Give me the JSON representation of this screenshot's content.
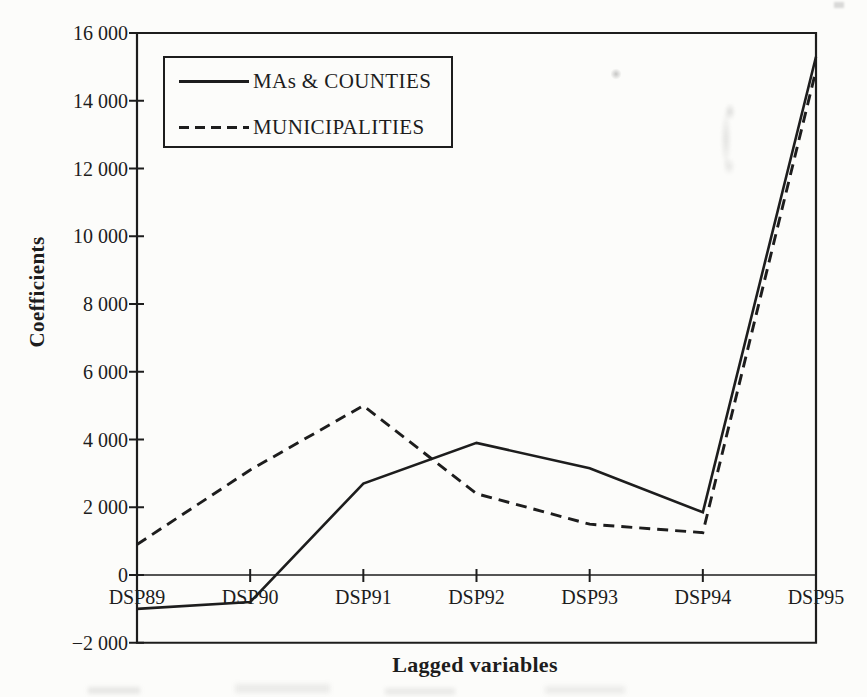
{
  "figure": {
    "background_color": "#fcfcfa",
    "ink_color": "#1d1d1d"
  },
  "chart_data": {
    "type": "line",
    "title": "",
    "xlabel": "Lagged variables",
    "ylabel": "Coefficients",
    "categories": [
      "DSP89",
      "DSP90",
      "DSP91",
      "DSP92",
      "DSP93",
      "DSP94",
      "DSP95"
    ],
    "series": [
      {
        "name": "MAs & COUNTIES",
        "style": "solid",
        "values": [
          -1000,
          -800,
          2700,
          3900,
          3150,
          1850,
          15300
        ]
      },
      {
        "name": "MUNICIPALITIES",
        "style": "dashed",
        "values": [
          900,
          3100,
          5000,
          2400,
          1500,
          1250,
          14900
        ]
      }
    ],
    "ylim": [
      -2000,
      16000
    ],
    "ytick_step": 2000,
    "ytick_labels": [
      "16 000",
      "14 000",
      "12 000",
      "10 000",
      "8 000",
      "6 000",
      "4 000",
      "2 000",
      "0",
      "−2 000"
    ],
    "grid": false,
    "zero_baseline": true,
    "legend_position": "top-left-inside"
  },
  "legend": {
    "items": [
      {
        "label": "MAs & COUNTIES",
        "line": "solid"
      },
      {
        "label": "MUNICIPALITIES",
        "line": "dashed"
      }
    ]
  }
}
